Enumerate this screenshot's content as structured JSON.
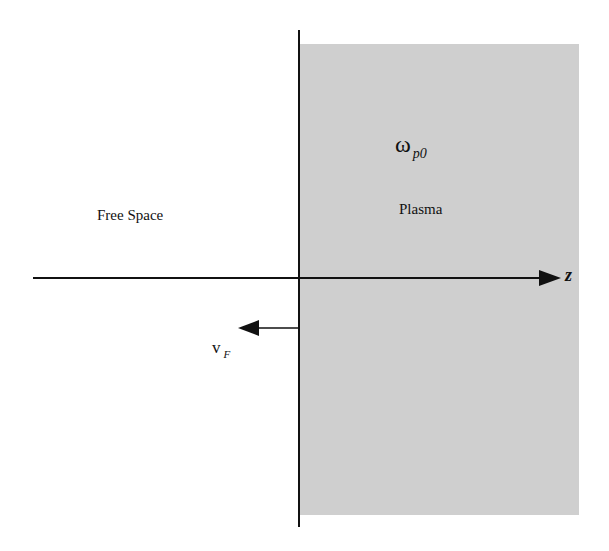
{
  "diagram": {
    "type": "physics-schematic",
    "regions": [
      {
        "name": "Free Space",
        "label": "Free Space",
        "fill": "#ffffff"
      },
      {
        "name": "Plasma",
        "label": "Plasma",
        "fill": "#cfcfcf"
      }
    ],
    "plasma_frequency": {
      "symbol": "ω",
      "subscript": "p0"
    },
    "axis": {
      "label": "z"
    },
    "velocity": {
      "symbol": "v",
      "subscript": "F",
      "direction": "left"
    }
  }
}
